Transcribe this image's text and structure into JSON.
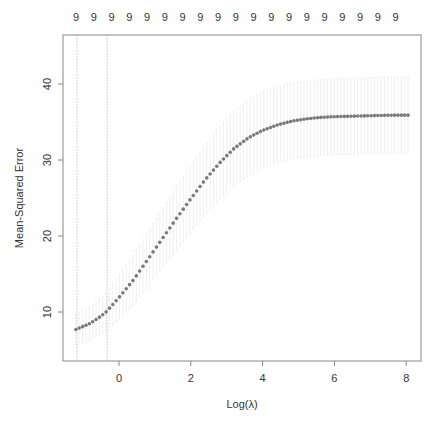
{
  "chart_data": {
    "type": "scatter",
    "title": "",
    "xlabel": "Log(λ)",
    "ylabel": "Mean-Squared Error",
    "xlim": [
      -1.25,
      8.35
    ],
    "ylim": [
      3.5,
      46.5
    ],
    "x_ticks": [
      0,
      2,
      4,
      6,
      8
    ],
    "y_ticks": [
      10,
      20,
      30,
      40
    ],
    "top_axis_labels": [
      "9",
      "9",
      "9",
      "9",
      "9",
      "9",
      "9",
      "9",
      "9",
      "9",
      "9",
      "9",
      "9",
      "9",
      "9",
      "9",
      "9",
      "9",
      "9"
    ],
    "vertical_reference_lines": [
      -1.17,
      -0.33
    ],
    "grid": false,
    "legend": null,
    "point_color": "#7a7a7a",
    "errorbar_color": "#e6e6e6",
    "series": [
      {
        "name": "cv_mse",
        "x": [
          -1.2,
          -0.8,
          -0.4,
          0.0,
          0.4,
          0.8,
          1.2,
          1.6,
          2.0,
          2.4,
          2.8,
          3.2,
          3.6,
          4.0,
          4.4,
          4.8,
          5.2,
          5.6,
          6.0,
          6.4,
          6.8,
          7.2,
          7.6,
          8.05
        ],
        "values": [
          7.7,
          8.5,
          9.8,
          11.9,
          14.2,
          16.9,
          19.6,
          22.3,
          24.9,
          27.4,
          29.6,
          31.5,
          32.9,
          33.9,
          34.6,
          35.1,
          35.4,
          35.6,
          35.7,
          35.75,
          35.8,
          35.85,
          35.9,
          35.9
        ],
        "err_low": [
          5.7,
          6.3,
          7.3,
          9.0,
          10.9,
          13.3,
          15.7,
          18.1,
          20.5,
          22.8,
          24.8,
          26.6,
          27.9,
          28.9,
          29.6,
          30.1,
          30.4,
          30.6,
          30.7,
          30.75,
          30.8,
          30.85,
          30.9,
          30.9
        ],
        "err_high": [
          9.7,
          10.7,
          12.3,
          14.8,
          17.5,
          20.5,
          23.5,
          26.5,
          29.3,
          32.0,
          34.4,
          36.4,
          37.9,
          38.9,
          39.6,
          40.1,
          40.4,
          40.6,
          40.7,
          40.75,
          40.8,
          40.85,
          40.9,
          40.9
        ]
      }
    ],
    "n_points": 100
  }
}
